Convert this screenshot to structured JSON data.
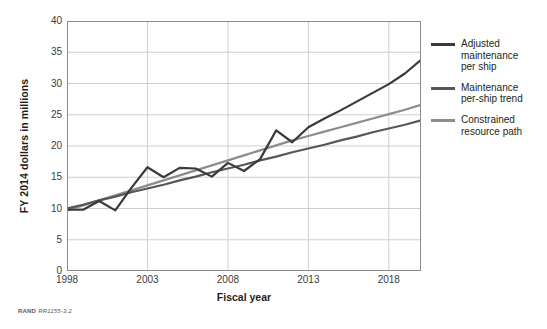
{
  "footer": {
    "brand": "RAND",
    "code": "RR1155-3.2"
  },
  "legend": {
    "items": [
      {
        "label": "Adjusted\nmaintenance\nper ship",
        "color": "#3a3a3a",
        "name": "adjusted-maintenance-per-ship"
      },
      {
        "label": "Maintenance\nper-ship trend",
        "color": "#575757",
        "name": "maintenance-per-ship-trend"
      },
      {
        "label": "Constrained\nresource path",
        "color": "#8d8d8d",
        "name": "constrained-resource-path"
      }
    ]
  },
  "chart_data": {
    "type": "line",
    "title": "",
    "xlabel": "Fiscal year",
    "ylabel": "FY 2014 dollars in millions",
    "xlim": [
      1998,
      2020
    ],
    "ylim": [
      0,
      40
    ],
    "xticks": [
      1998,
      2003,
      2008,
      2013,
      2018
    ],
    "yticks": [
      0,
      5,
      10,
      15,
      20,
      25,
      30,
      35,
      40
    ],
    "grid": "horizontal-and-vertical-at-xticks",
    "legend_position": "right",
    "x": [
      1998,
      1999,
      2000,
      2001,
      2002,
      2003,
      2004,
      2005,
      2006,
      2007,
      2008,
      2009,
      2010,
      2011,
      2012,
      2013,
      2014,
      2015,
      2016,
      2017,
      2018,
      2019,
      2020
    ],
    "series": [
      {
        "name": "Adjusted maintenance per ship",
        "color": "#3a3a3a",
        "width": 2.2,
        "values": [
          9.8,
          9.8,
          11.2,
          9.7,
          13.3,
          16.6,
          15.0,
          16.5,
          16.4,
          15.1,
          17.3,
          16.0,
          17.9,
          22.5,
          20.6,
          23.0,
          24.4,
          25.7,
          27.1,
          28.5,
          29.9,
          31.6,
          33.8
        ]
      },
      {
        "name": "Maintenance per-ship trend",
        "color": "#575757",
        "width": 2.2,
        "values": [
          10.0,
          10.6,
          11.3,
          11.9,
          12.6,
          13.2,
          13.8,
          14.5,
          15.1,
          15.8,
          16.4,
          17.0,
          17.7,
          18.3,
          19.0,
          19.6,
          20.2,
          20.9,
          21.5,
          22.2,
          22.8,
          23.4,
          24.1
        ]
      },
      {
        "name": "Constrained resource path",
        "color": "#8d8d8d",
        "width": 2.2,
        "values": [
          9.7,
          10.5,
          11.3,
          12.1,
          12.9,
          13.7,
          14.5,
          15.3,
          16.1,
          16.9,
          17.7,
          18.5,
          19.3,
          20.1,
          20.9,
          21.6,
          22.3,
          23.0,
          23.7,
          24.4,
          25.1,
          25.8,
          26.6
        ]
      }
    ]
  },
  "axes": {
    "ylabel": "FY 2014 dollars in millions",
    "xlabel": "Fiscal year"
  }
}
